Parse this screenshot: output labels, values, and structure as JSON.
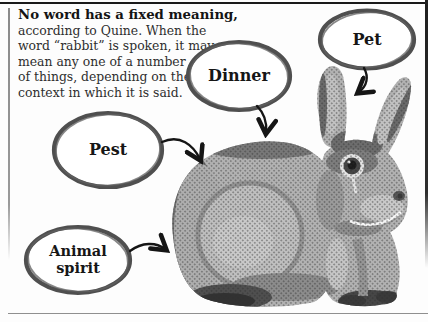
{
  "intro": {
    "heading": "No word has a fixed meaning,",
    "lines": [
      "according to Quine. When the",
      "word “rabbit” is spoken, it may",
      "mean any one of a number",
      "of things, depending on the",
      "context in which it is said."
    ]
  },
  "bubbles": {
    "pet": {
      "label": "Pet"
    },
    "dinner": {
      "label": "Dinner"
    },
    "pest": {
      "label": "Pest"
    },
    "animal_spirit": {
      "line1": "Animal",
      "line2": "spirit"
    }
  },
  "figure": {
    "icon": "rabbit-halftone-illustration"
  },
  "colors": {
    "ink": "#1a1a1a",
    "bubble_outline": "#4f4f4f",
    "frame_rule": "#1a1a1a",
    "thin_rule": "#8f8f8f",
    "halftone_gray": "#b0b0b0"
  }
}
